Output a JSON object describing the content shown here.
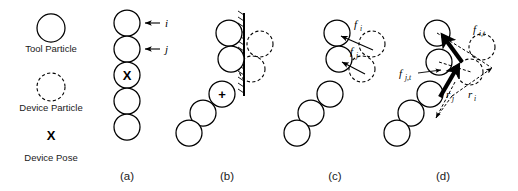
{
  "figure": {
    "background": "#ffffff",
    "ink": "#000000",
    "width": 518,
    "height": 191
  },
  "legend": {
    "items": [
      {
        "key": "tool-particle",
        "label": "Tool Particle",
        "glyph": "solid-circle"
      },
      {
        "key": "device-particle",
        "label": "Device Particle",
        "glyph": "dashed-circle"
      },
      {
        "key": "device-pose",
        "label": "Device Pose",
        "glyph": "X",
        "symbol": "X"
      }
    ]
  },
  "panels": [
    {
      "id": "a",
      "caption": "(a)",
      "description": "Straight vertical chain of tool particles with device pose marker",
      "pose_marker": "X",
      "annotations": [
        {
          "name": "index-i",
          "label": "i"
        },
        {
          "name": "index-j",
          "label": "j"
        }
      ]
    },
    {
      "id": "b",
      "caption": "(b)",
      "description": "Chain bent against a hatched rigid wall, device particles displaced",
      "pose_marker": "+",
      "annotations": []
    },
    {
      "id": "c",
      "caption": "(c)",
      "description": "Restoring forces from device particles acting on tool particles",
      "annotations": [
        {
          "name": "force-i",
          "base": "f",
          "sub": "i"
        },
        {
          "name": "force-j",
          "base": "f",
          "sub": "j"
        }
      ]
    },
    {
      "id": "d",
      "caption": "(d)",
      "description": "Torque contributions from tangential forces and lever arms",
      "annotations": [
        {
          "name": "force-i-tangential",
          "base": "f",
          "sub": "i,t"
        },
        {
          "name": "force-j-tangential",
          "base": "f",
          "sub": "j,t"
        },
        {
          "name": "radius-i",
          "base": "r",
          "sub": "i"
        },
        {
          "name": "radius-j",
          "base": "r",
          "sub": "j"
        }
      ]
    }
  ]
}
